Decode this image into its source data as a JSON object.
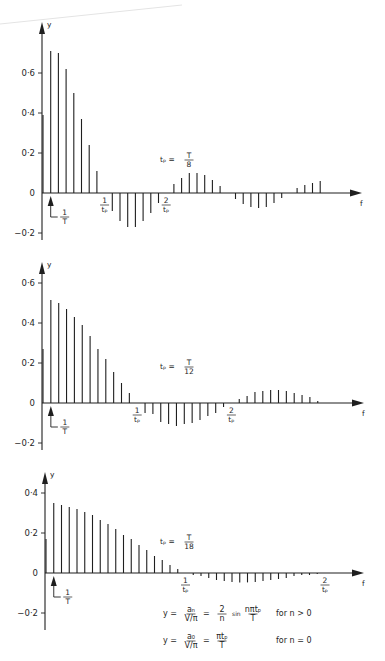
{
  "figure": {
    "formulas": [
      {
        "lhs": "y =",
        "frac1_num": "aₙ",
        "frac1_den": "V/π",
        "eq": "=",
        "coef_num": "2",
        "coef_den": "n",
        "func": "sin",
        "arg_num": "nπtₚ",
        "arg_den": "T",
        "condition": "for   n > 0"
      },
      {
        "lhs": "y =",
        "frac1_num": "a₀",
        "frac1_den": "V/π",
        "eq": "=",
        "coef_num": "πtₚ",
        "coef_den": "T",
        "condition": "for   n = 0"
      }
    ]
  },
  "chart_data": [
    {
      "type": "bar",
      "subtype": "line-spectrum (stem)",
      "title": "",
      "annotation": {
        "lhs": "tₚ =",
        "num": "T",
        "den": "8"
      },
      "xlabel": "f",
      "ylabel": "y",
      "ylim": [
        -0.2,
        0.7
      ],
      "yticks": [
        {
          "v": 0.6,
          "label": "0·6"
        },
        {
          "v": 0.4,
          "label": "0·4"
        },
        {
          "v": 0.2,
          "label": "0·2"
        },
        {
          "v": 0,
          "label": "0"
        },
        {
          "v": -0.2,
          "label": "−0·2"
        }
      ],
      "x_markers": [
        {
          "n": 1,
          "num": "1",
          "den": "T",
          "type": "arrow"
        },
        {
          "n": 8,
          "num": "1",
          "den": "tₚ"
        },
        {
          "n": 16,
          "num": "2",
          "den": "tₚ"
        }
      ],
      "harmonic_index": "n",
      "values": [
        0.39,
        0.71,
        0.7,
        0.62,
        0.5,
        0.37,
        0.24,
        0.11,
        0,
        -0.09,
        -0.14,
        -0.17,
        -0.17,
        -0.14,
        -0.1,
        -0.05,
        0,
        0.045,
        0.075,
        0.1,
        0.1,
        0.09,
        0.065,
        0.035,
        0,
        -0.03,
        -0.055,
        -0.07,
        -0.075,
        -0.07,
        -0.05,
        -0.025,
        0,
        0.025,
        0.04,
        0.05,
        0.06
      ],
      "grid": false
    },
    {
      "type": "bar",
      "subtype": "line-spectrum (stem)",
      "title": "",
      "annotation": {
        "lhs": "tₚ =",
        "num": "T",
        "den": "12"
      },
      "xlabel": "f",
      "ylabel": "y",
      "ylim": [
        -0.2,
        0.6
      ],
      "yticks": [
        {
          "v": 0.6,
          "label": "0·6"
        },
        {
          "v": 0.4,
          "label": "0·4"
        },
        {
          "v": 0.2,
          "label": "0·2"
        },
        {
          "v": 0,
          "label": "0"
        },
        {
          "v": -0.2,
          "label": "−0·2"
        }
      ],
      "x_markers": [
        {
          "n": 1,
          "num": "1",
          "den": "T",
          "type": "arrow"
        },
        {
          "n": 12,
          "num": "1",
          "den": "tₚ"
        },
        {
          "n": 24,
          "num": "2",
          "den": "tₚ"
        }
      ],
      "harmonic_index": "n",
      "values": [
        0.27,
        0.515,
        0.5,
        0.47,
        0.43,
        0.39,
        0.335,
        0.27,
        0.22,
        0.155,
        0.1,
        0.05,
        0,
        -0.05,
        -0.055,
        -0.095,
        -0.105,
        -0.115,
        -0.105,
        -0.1,
        -0.085,
        -0.065,
        -0.05,
        -0.02,
        0,
        0.02,
        0.035,
        0.055,
        0.06,
        0.065,
        0.065,
        0.06,
        0.05,
        0.04,
        0.03,
        0.01
      ],
      "grid": false
    },
    {
      "type": "bar",
      "subtype": "line-spectrum (stem)",
      "title": "",
      "annotation": {
        "lhs": "tₚ =",
        "num": "T",
        "den": "18"
      },
      "xlabel": "f",
      "ylabel": "y",
      "ylim": [
        -0.2,
        0.4
      ],
      "yticks": [
        {
          "v": 0.4,
          "label": "0·4"
        },
        {
          "v": 0.2,
          "label": "0·2"
        },
        {
          "v": 0,
          "label": "0"
        },
        {
          "v": -0.2,
          "label": "−0·2"
        }
      ],
      "x_markers": [
        {
          "n": 1,
          "num": "1",
          "den": "T",
          "type": "arrow"
        },
        {
          "n": 18,
          "num": "1",
          "den": "tₚ"
        },
        {
          "n": 36,
          "num": "2",
          "den": "tₚ"
        }
      ],
      "harmonic_index": "n",
      "values": [
        0.17,
        0.35,
        0.34,
        0.33,
        0.32,
        0.305,
        0.29,
        0.265,
        0.245,
        0.22,
        0.19,
        0.17,
        0.14,
        0.115,
        0.085,
        0.065,
        0.04,
        0.02,
        0,
        -0.01,
        -0.015,
        -0.025,
        -0.035,
        -0.04,
        -0.045,
        -0.047,
        -0.047,
        -0.045,
        -0.04,
        -0.035,
        -0.03,
        -0.025,
        -0.015,
        -0.01,
        -0.01,
        -0.005,
        0
      ],
      "grid": false
    }
  ],
  "layout": {
    "panels": [
      {
        "x0": 43,
        "dx": 7.7,
        "baseline": 193,
        "px_per_unit": 200,
        "axis_top": 22,
        "axis_bottom": 240,
        "arrow_x": 360,
        "annot_x": 160,
        "annot_y": 158
      },
      {
        "x0": 43,
        "dx": 7.85,
        "baseline": 403,
        "px_per_unit": 200,
        "axis_top": 262,
        "axis_bottom": 450,
        "arrow_x": 362,
        "annot_x": 160,
        "annot_y": 365
      },
      {
        "x0": 46,
        "dx": 7.75,
        "baseline": 573,
        "px_per_unit": 200,
        "axis_top": 472,
        "axis_bottom": 630,
        "arrow_x": 362,
        "annot_x": 160,
        "annot_y": 540
      }
    ]
  }
}
